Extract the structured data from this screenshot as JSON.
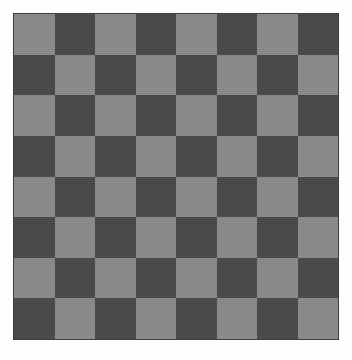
{
  "image": {
    "kind": "checkerboard-pattern",
    "width": 352,
    "height": 360
  },
  "board": {
    "name": "checkerboard",
    "rows": 8,
    "columns": 8,
    "total_squares": 64,
    "square_size_px": 40.6,
    "origin_x_px": 13,
    "origin_y_px": 13,
    "board_width_px": 326,
    "board_height_px": 327,
    "top_left_square_color": "light",
    "orientation": "alternating"
  },
  "colors": {
    "background": "#fdfdfd",
    "light_square": "#8a8a8a",
    "dark_square": "#484848",
    "border": "#3c3c3c"
  },
  "border": {
    "width_px": 1,
    "style": "solid",
    "color": "#3c3c3c"
  },
  "chart_data": {
    "type": "heatmap",
    "title": "",
    "xlabel": "",
    "ylabel": "",
    "categories": [
      "1",
      "2",
      "3",
      "4",
      "5",
      "6",
      "7",
      "8"
    ],
    "rows": [
      "1",
      "2",
      "3",
      "4",
      "5",
      "6",
      "7",
      "8"
    ],
    "grid": [
      [
        "light",
        "dark",
        "light",
        "dark",
        "light",
        "dark",
        "light",
        "dark"
      ],
      [
        "dark",
        "light",
        "dark",
        "light",
        "dark",
        "light",
        "dark",
        "light"
      ],
      [
        "light",
        "dark",
        "light",
        "dark",
        "light",
        "dark",
        "light",
        "dark"
      ],
      [
        "dark",
        "light",
        "dark",
        "light",
        "dark",
        "light",
        "dark",
        "light"
      ],
      [
        "light",
        "dark",
        "light",
        "dark",
        "light",
        "dark",
        "light",
        "dark"
      ],
      [
        "dark",
        "light",
        "dark",
        "light",
        "dark",
        "light",
        "dark",
        "light"
      ],
      [
        "light",
        "dark",
        "light",
        "dark",
        "light",
        "dark",
        "light",
        "dark"
      ],
      [
        "dark",
        "light",
        "dark",
        "light",
        "dark",
        "light",
        "dark",
        "light"
      ]
    ],
    "values": [
      [
        1,
        0,
        1,
        0,
        1,
        0,
        1,
        0
      ],
      [
        0,
        1,
        0,
        1,
        0,
        1,
        0,
        1
      ],
      [
        1,
        0,
        1,
        0,
        1,
        0,
        1,
        0
      ],
      [
        0,
        1,
        0,
        1,
        0,
        1,
        0,
        1
      ],
      [
        1,
        0,
        1,
        0,
        1,
        0,
        1,
        0
      ],
      [
        0,
        1,
        0,
        1,
        0,
        1,
        0,
        1
      ],
      [
        1,
        0,
        1,
        0,
        1,
        0,
        1,
        0
      ],
      [
        0,
        1,
        0,
        1,
        0,
        1,
        0,
        1
      ]
    ],
    "value_legend": {
      "0": "#484848",
      "1": "#8a8a8a"
    },
    "grid_lines": false,
    "legend_position": "none",
    "axis_visible": false
  }
}
